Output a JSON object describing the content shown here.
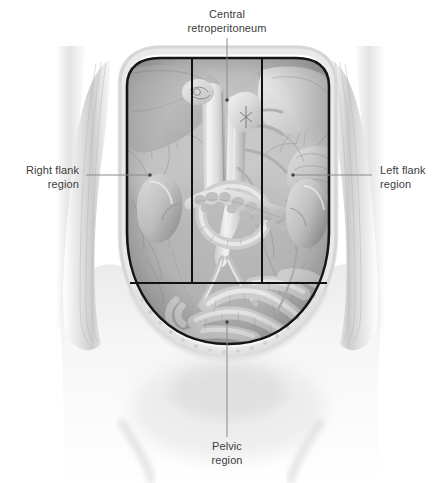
{
  "figure": {
    "type": "anatomical-illustration",
    "style": "grayscale medical drawing",
    "background_color": "#ffffff",
    "label_color": "#3d3d3d",
    "leader_color": "#8a8a8a",
    "grid_color": "#111111"
  },
  "labels": {
    "central": "Central\nretroperitoneum",
    "right_flank": "Right flank\nregion",
    "left_flank": "Left flank\nregion",
    "pelvic": "Pelvic\nregion"
  },
  "leaders": [
    {
      "name": "central-leader",
      "x1": 227,
      "y1": 38,
      "x2": 227,
      "y2": 100
    },
    {
      "name": "right-flank-leader",
      "x1": 86,
      "y1": 175,
      "x2": 150,
      "y2": 175
    },
    {
      "name": "left-flank-leader",
      "x1": 293,
      "y1": 175,
      "x2": 372,
      "y2": 175
    },
    {
      "name": "pelvic-leader",
      "x1": 227,
      "y1": 322,
      "x2": 227,
      "y2": 437
    }
  ],
  "region_grid": {
    "vertical_left_x": 192,
    "vertical_right_x": 262,
    "horizontal_y": 283,
    "top_y": 58,
    "bottom_y": 283
  },
  "structures": [
    "liver",
    "stomach",
    "duodenum",
    "pancreas",
    "right kidney",
    "left kidney",
    "abdominal aorta",
    "inferior vena cava",
    "small intestine",
    "sigmoid colon",
    "abdominal wall flap",
    "parietal peritoneum"
  ]
}
